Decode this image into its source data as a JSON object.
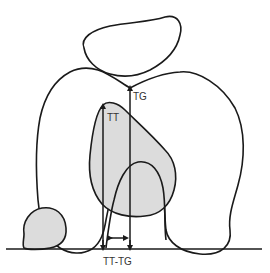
{
  "diagram": {
    "type": "anatomical-schematic",
    "labels": {
      "tg": "TG",
      "tt": "TT",
      "tt_tg": "TT-TG"
    },
    "colors": {
      "stroke": "#1a1a1a",
      "fill_shaded": "#dcdcdc",
      "background": "#ffffff",
      "text": "#333333"
    }
  }
}
